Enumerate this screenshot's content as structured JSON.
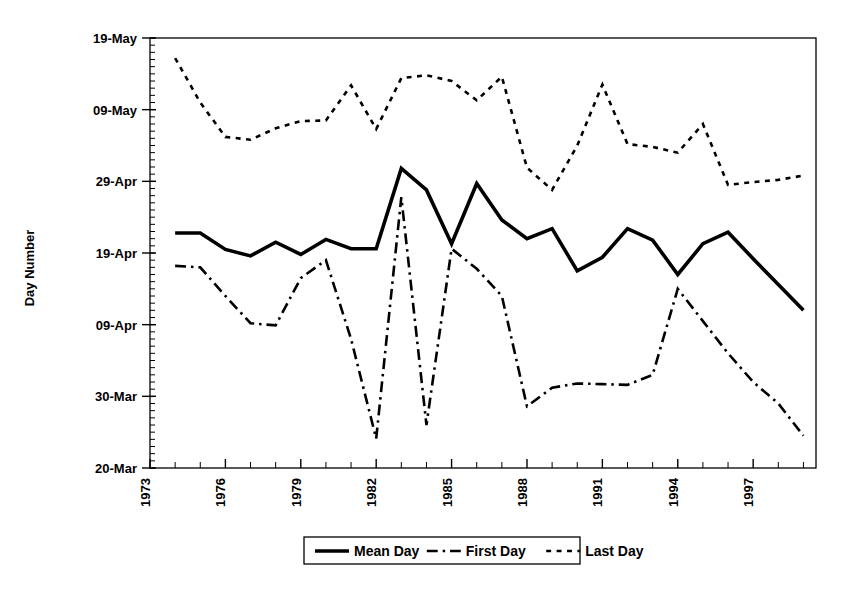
{
  "chart_data": {
    "type": "line",
    "title": "",
    "xlabel": "",
    "ylabel": "Day Number",
    "grid": false,
    "legend_position": "bottom",
    "x": [
      1974,
      1975,
      1976,
      1977,
      1978,
      1979,
      1980,
      1981,
      1982,
      1983,
      1984,
      1985,
      1986,
      1987,
      1988,
      1989,
      1990,
      1991,
      1992,
      1993,
      1994,
      1995,
      1996,
      1997,
      1998,
      1999
    ],
    "xlim": [
      1973,
      1999.5
    ],
    "xticks": [
      1973,
      1974,
      1975,
      1976,
      1977,
      1978,
      1979,
      1980,
      1981,
      1982,
      1983,
      1984,
      1985,
      1986,
      1987,
      1988,
      1989,
      1990,
      1991,
      1992,
      1993,
      1994,
      1995,
      1996,
      1997,
      1998,
      1999
    ],
    "xtick_labels": [
      "1973",
      "",
      "",
      "1976",
      "",
      "",
      "1979",
      "",
      "",
      "1982",
      "",
      "",
      "1985",
      "",
      "",
      "1988",
      "",
      "",
      "1991",
      "",
      "",
      "1994",
      "",
      "",
      "1997",
      "",
      ""
    ],
    "ylim": [
      79,
      139
    ],
    "yticks": [
      79,
      89,
      99,
      109,
      119,
      129,
      139
    ],
    "ytick_labels": [
      "20-Mar",
      "30-Mar",
      "09-Apr",
      "19-Apr",
      "29-Apr",
      "09-May",
      "19-May"
    ],
    "y_minor_tick_step": 1,
    "series": [
      {
        "name": "Mean Day",
        "style": "solid",
        "color": "#000000",
        "width": 3.6,
        "values": [
          111.8,
          111.8,
          109.5,
          108.6,
          110.5,
          108.8,
          110.9,
          109.6,
          109.6,
          120.8,
          117.8,
          110.3,
          118.7,
          113.6,
          111.0,
          112.4,
          106.5,
          108.4,
          112.4,
          110.8,
          106.0,
          110.3,
          111.9,
          108.2,
          104.6,
          101.0
        ]
      },
      {
        "name": "First Day",
        "style": "dashdot",
        "color": "#000000",
        "width": 2.6,
        "values": [
          107.2,
          107.0,
          103.0,
          99.2,
          98.9,
          105.5,
          108.0,
          97.0,
          83.1,
          116.8,
          85.0,
          109.6,
          106.8,
          103.0,
          87.6,
          90.2,
          90.8,
          90.7,
          90.6,
          92.0,
          104.0,
          99.5,
          95.0,
          91.0,
          88.0,
          83.5
        ]
      },
      {
        "name": "Last Day",
        "style": "dotted",
        "color": "#000000",
        "width": 2.6,
        "values": [
          136.2,
          130.0,
          125.2,
          124.8,
          126.4,
          127.4,
          127.5,
          132.4,
          126.3,
          133.4,
          133.8,
          133.0,
          130.3,
          133.6,
          120.9,
          117.8,
          124.0,
          132.5,
          124.2,
          123.8,
          123.0,
          127.0,
          118.5,
          118.9,
          119.2,
          119.8
        ]
      }
    ]
  },
  "legend": {
    "entries": [
      {
        "label": "Mean Day",
        "style": "solid"
      },
      {
        "label": "First Day",
        "style": "dashdot"
      },
      {
        "label": "Last Day",
        "style": "dotted"
      }
    ]
  }
}
